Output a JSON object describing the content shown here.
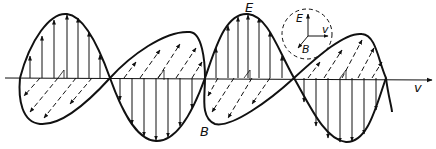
{
  "diagram": {
    "labels": {
      "electric_field": "E",
      "magnetic_field": "B",
      "velocity": "v"
    },
    "inset": {
      "labels": {
        "e": "E",
        "b": "B",
        "v": "v"
      }
    },
    "colors": {
      "ink": "#111111",
      "background": "#ffffff"
    }
  }
}
